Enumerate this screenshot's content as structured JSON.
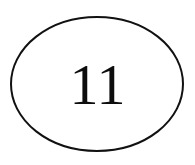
{
  "figure": {
    "type": "ellipse-node",
    "background_color": "#ffffff",
    "canvas": {
      "width": 195,
      "height": 165
    },
    "ellipse": {
      "label": "node-outline",
      "center_x": 97,
      "center_y": 84,
      "radius_x": 86,
      "radius_y": 67,
      "stroke_color": "#111111",
      "stroke_width": 2,
      "fill": "none"
    },
    "node": {
      "label": "11",
      "text_color": "#0d0d0d",
      "font_size": 58,
      "font_style": "serif"
    }
  }
}
